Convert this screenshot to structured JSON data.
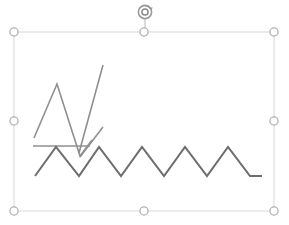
{
  "document": {
    "background_color": "#ffffff",
    "canvas_width": 289,
    "canvas_height": 225
  },
  "selection": {
    "state_label": "selected",
    "frame_color": "#d8d8d8",
    "handle_fill": "#ffffff",
    "handle_stroke": "#b0b0b0",
    "frame": {
      "x": 14,
      "y": 32,
      "width": 260,
      "height": 179
    },
    "handles": [
      {
        "name": "handle-top-left",
        "x": 14,
        "y": 32,
        "cursor": "nwse-resize"
      },
      {
        "name": "handle-top-center",
        "x": 144,
        "y": 32,
        "cursor": "ns-resize"
      },
      {
        "name": "handle-top-right",
        "x": 274,
        "y": 32,
        "cursor": "nesw-resize"
      },
      {
        "name": "handle-middle-left",
        "x": 14,
        "y": 121,
        "cursor": "ew-resize"
      },
      {
        "name": "handle-middle-right",
        "x": 274,
        "y": 121,
        "cursor": "ew-resize"
      },
      {
        "name": "handle-bottom-left",
        "x": 14,
        "y": 211,
        "cursor": "nesw-resize"
      },
      {
        "name": "handle-bottom-center",
        "x": 144,
        "y": 211,
        "cursor": "ns-resize"
      },
      {
        "name": "handle-bottom-right",
        "x": 274,
        "y": 211,
        "cursor": "nwse-resize"
      }
    ],
    "rotation_handle": {
      "name": "rotation-handle",
      "x": 145,
      "y": 12,
      "radius": 7,
      "stem_from_y": 19,
      "stem_to_y": 32,
      "color": "#9a9a9a",
      "icon": "rotate-icon"
    }
  },
  "chart_data": {
    "type": "line",
    "title": "",
    "subtitle": "",
    "xlabel": "",
    "ylabel": "",
    "grid": false,
    "legend_position": "none",
    "axis_visible": false,
    "xlim": [
      0,
      289
    ],
    "ylim_screen": [
      225,
      0
    ],
    "note": "Freehand line-chart sketch: screen pixel coordinates, y grows downward.",
    "series": [
      {
        "name": "series-1-peak",
        "color": "#8f8f8f",
        "stroke_width": 1.6,
        "points": [
          [
            34,
            138
          ],
          [
            57,
            84
          ],
          [
            80,
            156
          ],
          [
            92,
            140
          ]
        ]
      },
      {
        "name": "series-2-rising",
        "color": "#8f8f8f",
        "stroke_width": 1.6,
        "points": [
          [
            79,
            153
          ],
          [
            103,
            65
          ]
        ]
      },
      {
        "name": "series-3-baseline",
        "color": "#8f8f8f",
        "stroke_width": 1.6,
        "points": [
          [
            33,
            146
          ],
          [
            66,
            146
          ],
          [
            90,
            146
          ]
        ]
      },
      {
        "name": "series-4-short-rise",
        "color": "#8f8f8f",
        "stroke_width": 1.6,
        "points": [
          [
            80,
            157
          ],
          [
            103,
            127
          ]
        ]
      },
      {
        "name": "series-5-zigzag",
        "color": "#6d6d6d",
        "stroke_width": 2,
        "points": [
          [
            35,
            176
          ],
          [
            56,
            147
          ],
          [
            79,
            176
          ],
          [
            99,
            147
          ],
          [
            121,
            176
          ],
          [
            142,
            147
          ],
          [
            164,
            176
          ],
          [
            185,
            147
          ],
          [
            207,
            176
          ],
          [
            228,
            147
          ],
          [
            250,
            176
          ],
          [
            262,
            176
          ]
        ]
      }
    ]
  }
}
